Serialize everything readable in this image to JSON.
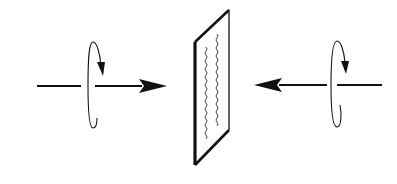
{
  "diagram": {
    "colors": {
      "stroke": "#111111",
      "background": "#ffffff"
    },
    "left_beam": {
      "direction": "right",
      "rotation": "clockwise-arrow",
      "label": "left-incident-beam"
    },
    "right_beam": {
      "direction": "left",
      "rotation": "clockwise-arrow",
      "label": "right-incident-beam"
    },
    "plate": {
      "wavy_lines": 2,
      "label": "plate-with-standing-wave"
    }
  }
}
